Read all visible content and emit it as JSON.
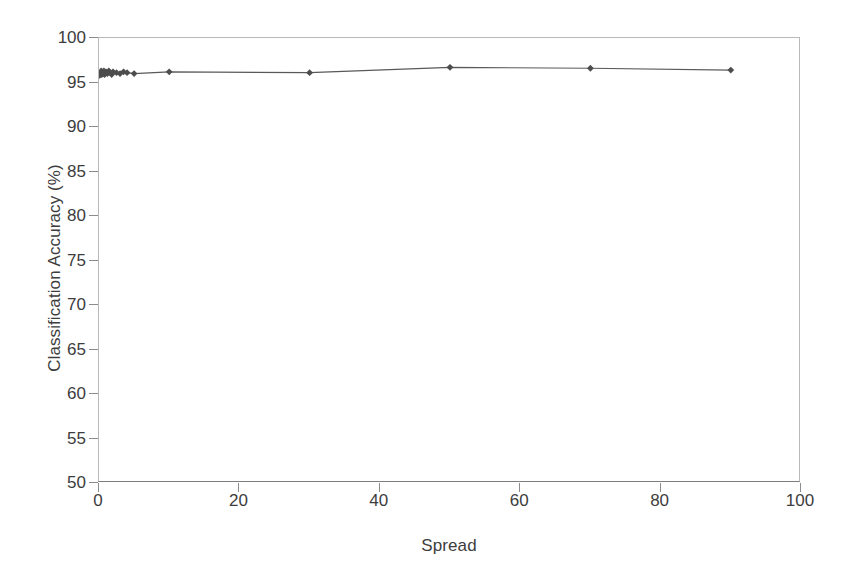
{
  "chart_data": {
    "type": "line",
    "title": "",
    "subtitle": "",
    "xlabel": "Spread",
    "ylabel": "Classification Accuracy (%)",
    "xlim": [
      0,
      100
    ],
    "ylim": [
      50,
      100
    ],
    "xticks": [
      0,
      20,
      40,
      60,
      80,
      100
    ],
    "yticks": [
      50,
      55,
      60,
      65,
      70,
      75,
      80,
      85,
      90,
      95,
      100
    ],
    "grid": false,
    "legend": "none",
    "marker": "diamond",
    "marker_color": "#4d4d4d",
    "line_color": "#595959",
    "series": [
      {
        "name": "Classification Accuracy",
        "x": [
          0.1,
          0.2,
          0.3,
          0.4,
          0.5,
          0.6,
          0.7,
          0.8,
          0.9,
          1.0,
          1.2,
          1.4,
          1.6,
          1.8,
          2.0,
          2.5,
          3.0,
          3.5,
          4.0,
          5.0,
          10,
          30,
          50,
          70,
          90
        ],
        "y": [
          95.8,
          96.1,
          96.3,
          95.9,
          96.2,
          96.0,
          96.3,
          95.9,
          96.1,
          96.2,
          96.0,
          96.3,
          96.1,
          95.9,
          96.2,
          96.1,
          96.0,
          96.2,
          96.1,
          96.0,
          96.2,
          96.1,
          96.7,
          96.6,
          96.4
        ]
      }
    ]
  },
  "axis": {
    "y_tick_labels": [
      "100",
      "95",
      "90",
      "85",
      "80",
      "75",
      "70",
      "65",
      "60",
      "55",
      "50"
    ],
    "x_tick_labels": [
      "0",
      "20",
      "40",
      "60",
      "80",
      "100"
    ]
  }
}
